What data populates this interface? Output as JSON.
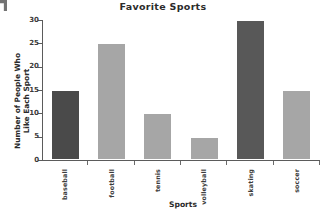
{
  "chart_data": {
    "type": "bar",
    "title": "Favorite Sports",
    "xlabel": "Sports",
    "ylabel": "Number of People Who\nLike Each Sport",
    "categories": [
      "baseball",
      "football",
      "tennis",
      "volleyball",
      "skating",
      "soccer"
    ],
    "values": [
      15,
      25,
      10,
      5,
      30,
      15
    ],
    "yticks": [
      0,
      5,
      10,
      15,
      20,
      25,
      30
    ],
    "ylim": [
      0,
      30
    ],
    "grid": false,
    "legend": "none",
    "bar_colors": [
      "#4a4a4a",
      "#a6a6a6",
      "#a6a6a6",
      "#a6a6a6",
      "#585858",
      "#a6a6a6"
    ],
    "colors": {
      "background": "#ffffff",
      "axis": "#5b5b5b",
      "text": "#2b2b2b",
      "bar_dark": "#4a4a4a",
      "bar_light": "#a6a6a6",
      "bar_mid_dark": "#585858"
    }
  }
}
